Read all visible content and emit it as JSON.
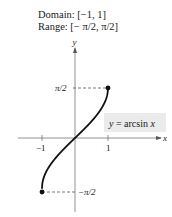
{
  "header": {
    "domain_line": "Domain: [−1,  1]",
    "range_line": "Range: [− π/2,  π/2]"
  },
  "chart_data": {
    "type": "line",
    "title": "",
    "function_label": "y  =  arcsin x",
    "xlabel": "x",
    "ylabel": "y",
    "domain": [
      -1,
      1
    ],
    "range": [
      "-π/2",
      "π/2"
    ],
    "x_ticks": [
      {
        "value": -1,
        "label": "−1"
      },
      {
        "value": 1,
        "label": "1"
      }
    ],
    "y_ticks": [
      {
        "value": 1.5708,
        "label": "π/2"
      },
      {
        "value": -1.5708,
        "label": "−π/2"
      }
    ],
    "series": [
      {
        "name": "y = arcsin x",
        "x": [
          -1,
          -0.95,
          -0.9,
          -0.8,
          -0.7,
          -0.6,
          -0.5,
          -0.4,
          -0.3,
          -0.2,
          -0.1,
          0,
          0.1,
          0.2,
          0.3,
          0.4,
          0.5,
          0.6,
          0.7,
          0.8,
          0.9,
          0.95,
          1
        ],
        "y": [
          -1.5708,
          -1.2532,
          -1.1198,
          -0.9273,
          -0.7754,
          -0.6435,
          -0.5236,
          -0.4115,
          -0.3047,
          -0.2014,
          -0.1002,
          0,
          0.1002,
          0.2014,
          0.3047,
          0.4115,
          0.5236,
          0.6435,
          0.7754,
          0.9273,
          1.1198,
          1.2532,
          1.5708
        ]
      }
    ],
    "endpoints": [
      {
        "x": -1,
        "y": -1.5708,
        "closed": true
      },
      {
        "x": 1,
        "y": 1.5708,
        "closed": true
      }
    ],
    "guides": "dashed lines from endpoints to y-axis",
    "grid": false,
    "legend": "none; boxed function label at right of curve"
  }
}
